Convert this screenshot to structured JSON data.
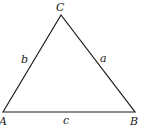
{
  "diagram": {
    "type": "triangle",
    "vertices": [
      {
        "id": "A",
        "label": "A",
        "x": 3,
        "y": 112
      },
      {
        "id": "B",
        "label": "B",
        "x": 135,
        "y": 112
      },
      {
        "id": "C",
        "label": "C",
        "x": 61,
        "y": 15
      }
    ],
    "sides": [
      {
        "id": "a",
        "label": "a",
        "from": "C",
        "to": "B"
      },
      {
        "id": "b",
        "label": "b",
        "from": "A",
        "to": "C"
      },
      {
        "id": "c",
        "label": "c",
        "from": "A",
        "to": "B"
      }
    ],
    "stroke_color": "#1a1a1a",
    "background": "#ffffff"
  }
}
